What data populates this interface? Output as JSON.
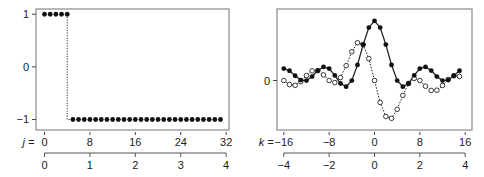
{
  "chart_data": [
    {
      "type": "scatter",
      "title": "",
      "xlabel": "j =",
      "ylabel": "",
      "x_ticks": [
        0,
        8,
        16,
        24,
        32
      ],
      "secondary_x_ticks": [
        0,
        1,
        2,
        3,
        4
      ],
      "y_ticks": [
        1,
        0,
        -1
      ],
      "xlim": [
        -1.5,
        32.5
      ],
      "ylim": [
        -1.2,
        1.1
      ],
      "grid": false,
      "legend": null,
      "connector": "dotted step",
      "series": [
        {
          "name": "x[j]",
          "marker": "filled-circle",
          "x": [
            0,
            1,
            2,
            3,
            4,
            5,
            6,
            7,
            8,
            9,
            10,
            11,
            12,
            13,
            14,
            15,
            16,
            17,
            18,
            19,
            20,
            21,
            22,
            23,
            24,
            25,
            26,
            27,
            28,
            29,
            30,
            31
          ],
          "values": [
            1,
            1,
            1,
            1,
            1,
            -1,
            -1,
            -1,
            -1,
            -1,
            -1,
            -1,
            -1,
            -1,
            -1,
            -1,
            -1,
            -1,
            -1,
            -1,
            -1,
            -1,
            -1,
            -1,
            -1,
            -1,
            -1,
            -1,
            -1,
            -1,
            -1,
            -1
          ]
        }
      ]
    },
    {
      "type": "line",
      "title": "",
      "xlabel": "k =",
      "ylabel": "",
      "x_ticks": [
        -16,
        -8,
        0,
        8,
        16
      ],
      "secondary_x_ticks": [
        -4,
        -2,
        0,
        2,
        4
      ],
      "y_ticks": [
        0
      ],
      "xlim": [
        -17.2,
        17.2
      ],
      "ylim": [
        -8.3,
        12.0
      ],
      "grid": false,
      "legend": null,
      "x": [
        -16,
        -15,
        -14,
        -13,
        -12,
        -11,
        -10,
        -9,
        -8,
        -7,
        -6,
        -5,
        -4,
        -3,
        -2,
        -1,
        0,
        1,
        2,
        3,
        4,
        5,
        6,
        7,
        8,
        9,
        10,
        11,
        12,
        13,
        14,
        15
      ],
      "series": [
        {
          "name": "real part",
          "marker": "filled-circle",
          "line": "solid",
          "values": [
            2.0,
            1.64,
            0.8,
            0.08,
            0.0,
            0.67,
            1.67,
            2.29,
            2.0,
            0.85,
            -0.5,
            -1.03,
            0.0,
            2.62,
            6.03,
            8.88,
            10.0,
            8.88,
            6.03,
            2.62,
            0.0,
            -1.03,
            -0.5,
            0.85,
            2.0,
            2.29,
            1.67,
            0.67,
            0.0,
            0.08,
            0.8,
            1.64
          ]
        },
        {
          "name": "imaginary part",
          "marker": "open-circle",
          "line": "dotted",
          "values": [
            0.0,
            -0.68,
            -0.8,
            -0.19,
            0.83,
            1.62,
            1.67,
            0.95,
            0.0,
            -0.35,
            0.5,
            2.49,
            4.83,
            6.34,
            6.03,
            3.68,
            0.0,
            -3.68,
            -6.03,
            -6.34,
            -4.83,
            -2.49,
            -0.5,
            0.35,
            0.0,
            -0.95,
            -1.67,
            -1.62,
            -0.83,
            0.19,
            0.8,
            0.68
          ]
        }
      ]
    }
  ],
  "labels": {
    "left_axis_var": "j =",
    "right_axis_var": "k ="
  }
}
